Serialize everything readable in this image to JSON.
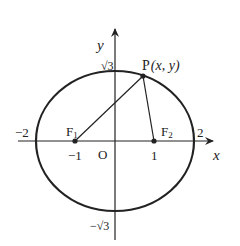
{
  "diagram": {
    "type": "ellipse-coordinate-diagram",
    "axes": {
      "x_label": "x",
      "y_label": "y",
      "origin_label": "O"
    },
    "ticks": {
      "x_neg2": "−2",
      "x_pos2": "2",
      "x_neg1": "−1",
      "x_pos1": "1",
      "y_pos_sqrt3": "√3",
      "y_neg_sqrt3": "−√3"
    },
    "foci": {
      "f1_label": "F",
      "f1_sub": "1",
      "f2_label": "F",
      "f2_sub": "2"
    },
    "point": {
      "label": "P",
      "coords": "(x, y)"
    },
    "colors": {
      "stroke": "#222222",
      "background": "#ffffff"
    }
  }
}
